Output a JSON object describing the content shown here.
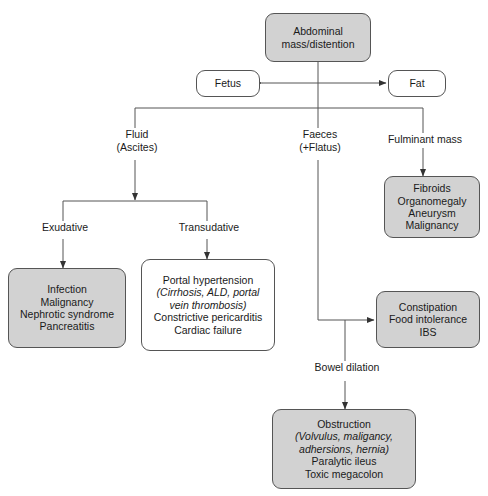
{
  "diagram": {
    "colors": {
      "node_fill_gray": "#d2d2d2",
      "node_fill_white": "#ffffff",
      "border": "#555555",
      "connector": "#555555",
      "text": "#1a1a1a"
    },
    "nodes": {
      "root": {
        "name": "abdominal-mass",
        "lines": [
          "Abdominal",
          "mass/distention"
        ],
        "fill": "gray"
      },
      "fetus": {
        "name": "fetus",
        "lines": [
          "Fetus"
        ],
        "fill": "white"
      },
      "fat": {
        "name": "fat",
        "lines": [
          "Fat"
        ],
        "fill": "white"
      },
      "fibroids": {
        "name": "fulminant-mass-causes",
        "lines": [
          "Fibroids",
          "Organomegaly",
          "Aneurysm",
          "Malignancy"
        ],
        "fill": "gray"
      },
      "exudative_causes": {
        "name": "exudative-causes",
        "lines": [
          "Infection",
          "Malignancy",
          "Nephrotic syndrome",
          "Pancreatitis"
        ],
        "fill": "gray"
      },
      "transudative_causes": {
        "name": "transudative-causes",
        "lines": [
          "Portal hypertension",
          "(Cirrhosis, ALD, portal",
          "vein thrombosis)",
          "Constrictive pericarditis",
          "Cardiac failure"
        ],
        "italic_lines": [
          1,
          2
        ],
        "fill": "white"
      },
      "constipation": {
        "name": "faeces-causes",
        "lines": [
          "Constipation",
          "Food intolerance",
          "IBS"
        ],
        "fill": "gray"
      },
      "obstruction": {
        "name": "bowel-dilation-causes",
        "lines": [
          "Obstruction",
          "(Volvulus, maligancy,",
          "adhersions, hernia)",
          "Paralytic ileus",
          "Toxic megacolon"
        ],
        "italic_lines": [
          1,
          2
        ],
        "fill": "gray"
      }
    },
    "labels": {
      "fluid": {
        "name": "branch-label-fluid",
        "lines": [
          "Fluid",
          "(Ascites)"
        ]
      },
      "faeces": {
        "name": "branch-label-faeces",
        "lines": [
          "Faeces",
          "(+Flatus)"
        ]
      },
      "fulminant": {
        "name": "branch-label-fulminant-mass",
        "lines": [
          "Fulminant mass"
        ]
      },
      "exudative": {
        "name": "branch-label-exudative",
        "lines": [
          "Exudative"
        ]
      },
      "transudative": {
        "name": "branch-label-transudative",
        "lines": [
          "Transudative"
        ]
      },
      "bowel_dilation": {
        "name": "branch-label-bowel-dilation",
        "lines": [
          "Bowel dilation"
        ]
      }
    }
  }
}
